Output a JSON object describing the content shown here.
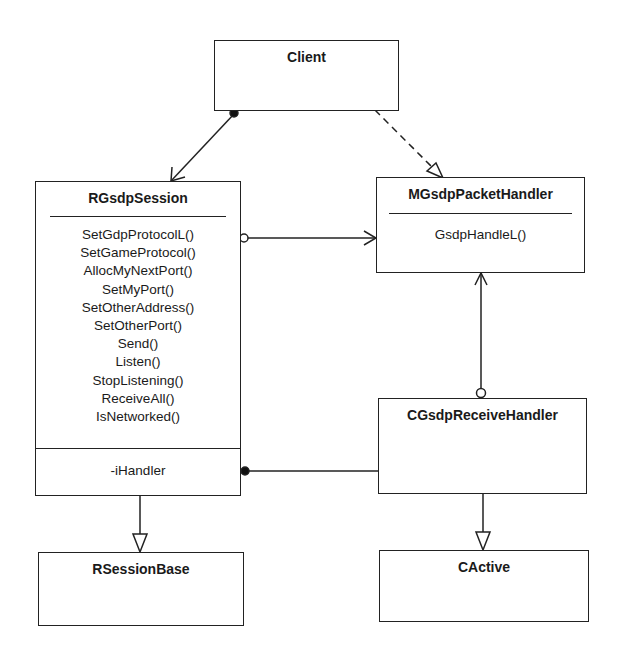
{
  "diagram": {
    "type": "uml-class-diagram",
    "classes": {
      "client": {
        "name": "Client"
      },
      "session": {
        "name": "RGsdpSession",
        "operations": [
          "SetGdpProtocolL()",
          "SetGameProtocol()",
          "AllocMyNextPort()",
          "SetMyPort()",
          "SetOtherAddress()",
          "SetOtherPort()",
          "Send()",
          "Listen()",
          "StopListening()",
          "ReceiveAll()",
          "IsNetworked()"
        ],
        "attributes": [
          "-iHandler"
        ]
      },
      "packet_handler": {
        "name": "MGsdpPacketHandler",
        "operations": [
          "GsdpHandleL()"
        ]
      },
      "receive_handler": {
        "name": "CGsdpReceiveHandler"
      },
      "session_base": {
        "name": "RSessionBase"
      },
      "active": {
        "name": "CActive"
      }
    },
    "relationships": [
      {
        "from": "Client",
        "to": "RGsdpSession",
        "kind": "association",
        "from_end": "filled-dot",
        "to_end": "open-arrow"
      },
      {
        "from": "Client",
        "to": "MGsdpPacketHandler",
        "kind": "dependency-realization",
        "style": "dashed",
        "to_end": "hollow-triangle"
      },
      {
        "from": "RGsdpSession",
        "to": "MGsdpPacketHandler",
        "kind": "association",
        "from_end": "hollow-circle",
        "to_end": "open-arrow"
      },
      {
        "from": "CGsdpReceiveHandler",
        "to": "MGsdpPacketHandler",
        "kind": "association",
        "from_end": "hollow-circle",
        "to_end": "open-arrow"
      },
      {
        "from": "RGsdpSession",
        "to": "CGsdpReceiveHandler",
        "kind": "association",
        "from_end": "filled-dot",
        "label": "-iHandler"
      },
      {
        "from": "RGsdpSession",
        "to": "RSessionBase",
        "kind": "generalization",
        "to_end": "hollow-triangle"
      },
      {
        "from": "CGsdpReceiveHandler",
        "to": "CActive",
        "kind": "generalization",
        "to_end": "hollow-triangle"
      }
    ]
  }
}
